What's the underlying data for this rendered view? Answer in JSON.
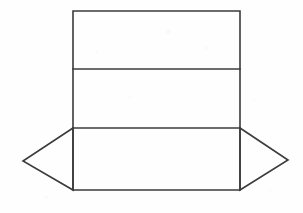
{
  "figure": {
    "canvas": {
      "width": 303,
      "height": 213
    },
    "background_color": "#fefefe",
    "stroke_color": "#3b3b3b",
    "stroke_width": 1.6,
    "fill_color": "none"
  },
  "geometry": {
    "body": {
      "label": "main panel column",
      "left_x": 73,
      "right_x": 240,
      "top_y": 11,
      "bottom_y": 190,
      "outline_points": "73,11 240,11 240,190 73,190"
    },
    "fold_lines": [
      {
        "name": "upper-fold-line",
        "y": 69,
        "x1": 73,
        "x2": 240
      },
      {
        "name": "lower-fold-line",
        "y": 128,
        "x1": 73,
        "x2": 240
      }
    ],
    "panels": [
      {
        "name": "top-panel",
        "top_y": 11,
        "bottom_y": 69,
        "height": 58
      },
      {
        "name": "middle-panel",
        "top_y": 69,
        "bottom_y": 128,
        "height": 59
      },
      {
        "name": "bottom-panel",
        "top_y": 128,
        "bottom_y": 190,
        "height": 62
      }
    ],
    "flaps": [
      {
        "name": "left-flap",
        "apex_x": 23,
        "apex_y": 161,
        "hinge_top_x": 73,
        "hinge_top_y": 128,
        "hinge_bottom_x": 73,
        "hinge_bottom_y": 190,
        "points": "73,128 23,161 73,190"
      },
      {
        "name": "right-flap",
        "apex_x": 288,
        "apex_y": 160,
        "hinge_top_x": 240,
        "hinge_top_y": 128,
        "hinge_bottom_x": 240,
        "hinge_bottom_y": 190,
        "points": "240,128 288,160 240,190"
      }
    ]
  },
  "artifacts": [
    {
      "x": 168,
      "y": 31,
      "size": 5,
      "opacity": 0.55
    },
    {
      "x": 96,
      "y": 52,
      "size": 3,
      "opacity": 0.4
    },
    {
      "x": 206,
      "y": 47,
      "size": 4,
      "opacity": 0.35
    },
    {
      "x": 130,
      "y": 96,
      "size": 3,
      "opacity": 0.3
    },
    {
      "x": 254,
      "y": 100,
      "size": 3,
      "opacity": 0.3
    },
    {
      "x": 45,
      "y": 196,
      "size": 4,
      "opacity": 0.3
    },
    {
      "x": 270,
      "y": 190,
      "size": 3,
      "opacity": 0.3
    }
  ]
}
